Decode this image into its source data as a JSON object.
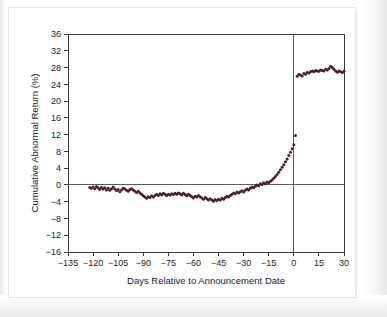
{
  "figure": {
    "background_color": "#ffffff",
    "frame_color": "#e2e4e6"
  },
  "chart_data": {
    "type": "scatter",
    "title": "",
    "subtitle": "",
    "xlabel": "Days Relative to Announcement Date",
    "ylabel": "Cumulative Abnormal Return (%)",
    "xlim": [
      -135,
      30
    ],
    "ylim": [
      -16,
      36
    ],
    "xticks": [
      -135,
      -120,
      -105,
      -90,
      -75,
      -60,
      -45,
      -30,
      -15,
      0,
      15,
      30
    ],
    "xtick_labels": [
      "−135",
      "−120",
      "−105",
      "−90",
      "−75",
      "−60",
      "−45",
      "−30",
      "−15",
      "0",
      "15",
      "30"
    ],
    "yticks": [
      -16,
      -12,
      -8,
      -4,
      0,
      4,
      8,
      12,
      16,
      20,
      24,
      28,
      32,
      36
    ],
    "ytick_labels": [
      "−16",
      "−12",
      "−8",
      "−4",
      "0",
      "4",
      "8",
      "12",
      "16",
      "20",
      "24",
      "28",
      "32",
      "36"
    ],
    "grid": false,
    "legend": null,
    "marker_color": "#4a1f2e",
    "marker_size": 1.5,
    "reference_lines": [
      {
        "orientation": "horizontal",
        "value": 0,
        "color": "#5b5b66"
      },
      {
        "orientation": "vertical",
        "value": 0,
        "color": "#5b5b66"
      }
    ],
    "annotations": [],
    "series_name": "Cumulative Abnormal Return",
    "x": [
      -122,
      -121,
      -120,
      -119,
      -118,
      -117,
      -116,
      -115,
      -114,
      -113,
      -112,
      -111,
      -110,
      -109,
      -108,
      -107,
      -106,
      -105,
      -104,
      -103,
      -102,
      -101,
      -100,
      -99,
      -98,
      -97,
      -96,
      -95,
      -94,
      -93,
      -92,
      -91,
      -90,
      -89,
      -88,
      -87,
      -86,
      -85,
      -84,
      -83,
      -82,
      -81,
      -80,
      -79,
      -78,
      -77,
      -76,
      -75,
      -74,
      -73,
      -72,
      -71,
      -70,
      -69,
      -68,
      -67,
      -66,
      -65,
      -64,
      -63,
      -62,
      -61,
      -60,
      -59,
      -58,
      -57,
      -56,
      -55,
      -54,
      -53,
      -52,
      -51,
      -50,
      -49,
      -48,
      -47,
      -46,
      -45,
      -44,
      -43,
      -42,
      -41,
      -40,
      -39,
      -38,
      -37,
      -36,
      -35,
      -34,
      -33,
      -32,
      -31,
      -30,
      -29,
      -28,
      -27,
      -26,
      -25,
      -24,
      -23,
      -22,
      -21,
      -20,
      -19,
      -18,
      -17,
      -16,
      -15,
      -14,
      -13,
      -12,
      -11,
      -10,
      -9,
      -8,
      -7,
      -6,
      -5,
      -4,
      -3,
      -2,
      -1,
      0,
      1,
      2,
      3,
      4,
      5,
      6,
      7,
      8,
      9,
      10,
      11,
      12,
      13,
      14,
      15,
      16,
      17,
      18,
      19,
      20,
      21,
      22,
      23,
      24,
      25,
      26,
      27,
      28,
      29,
      30
    ],
    "y": [
      -0.6,
      -0.8,
      -0.5,
      -0.9,
      -0.4,
      -0.7,
      -1.1,
      -0.6,
      -1.0,
      -0.7,
      -1.2,
      -0.8,
      -1.3,
      -0.9,
      -0.5,
      -1.0,
      -1.4,
      -1.1,
      -1.6,
      -1.2,
      -0.8,
      -1.0,
      -1.3,
      -1.5,
      -1.1,
      -0.9,
      -1.2,
      -1.5,
      -1.8,
      -1.5,
      -1.9,
      -2.2,
      -2.6,
      -2.9,
      -3.2,
      -2.8,
      -3.0,
      -2.6,
      -2.9,
      -2.5,
      -2.2,
      -2.5,
      -2.1,
      -2.4,
      -2.0,
      -2.2,
      -2.5,
      -2.2,
      -2.4,
      -2.1,
      -2.3,
      -2.0,
      -2.2,
      -1.9,
      -2.1,
      -2.4,
      -2.0,
      -2.3,
      -2.6,
      -2.2,
      -2.5,
      -2.8,
      -3.1,
      -2.7,
      -2.9,
      -2.5,
      -2.8,
      -3.1,
      -3.4,
      -3.0,
      -3.3,
      -3.6,
      -3.3,
      -3.6,
      -3.9,
      -3.5,
      -3.7,
      -3.4,
      -3.6,
      -3.2,
      -3.4,
      -3.0,
      -2.7,
      -2.9,
      -2.5,
      -2.2,
      -1.9,
      -2.1,
      -1.7,
      -1.9,
      -1.6,
      -1.4,
      -1.7,
      -1.3,
      -1.0,
      -1.2,
      -0.8,
      -0.5,
      -0.7,
      -0.3,
      0.0,
      -0.2,
      0.3,
      0.1,
      0.5,
      0.3,
      0.7,
      0.5,
      0.9,
      1.2,
      1.6,
      2.0,
      2.5,
      3.0,
      3.6,
      4.2,
      4.8,
      5.5,
      6.2,
      7.0,
      7.8,
      8.6,
      9.6,
      11.8,
      25.9,
      26.4,
      26.2,
      26.0,
      26.6,
      26.4,
      26.8,
      26.7,
      27.0,
      27.2,
      27.0,
      27.3,
      27.2,
      27.1,
      27.4,
      27.3,
      27.2,
      27.6,
      27.4,
      27.8,
      28.3,
      28.0,
      27.6,
      27.2,
      26.9,
      27.2,
      27.0,
      26.8,
      27.1,
      27.0,
      27.2,
      27.1
    ]
  }
}
